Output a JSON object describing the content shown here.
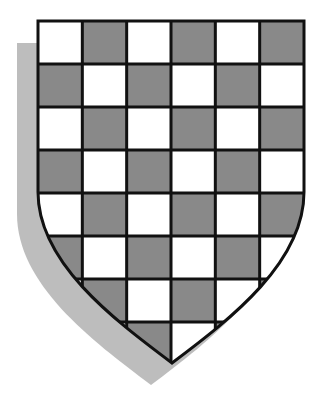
{
  "figure": {
    "grid": {
      "columns": 6,
      "rows": 8,
      "first_cell": "white"
    },
    "colors": {
      "background": "#ffffff",
      "light_square": "#ffffff",
      "dark_square": "#898989",
      "outline": "#111111",
      "shadow": "#bdbdbd"
    },
    "geometry": {
      "shield_left": 38,
      "shield_right": 304,
      "shield_top": 21,
      "curve_start_y": 192,
      "point_x": 172,
      "point_y": 363,
      "shadow_offset_x": -21,
      "shadow_offset_y": 22
    }
  }
}
